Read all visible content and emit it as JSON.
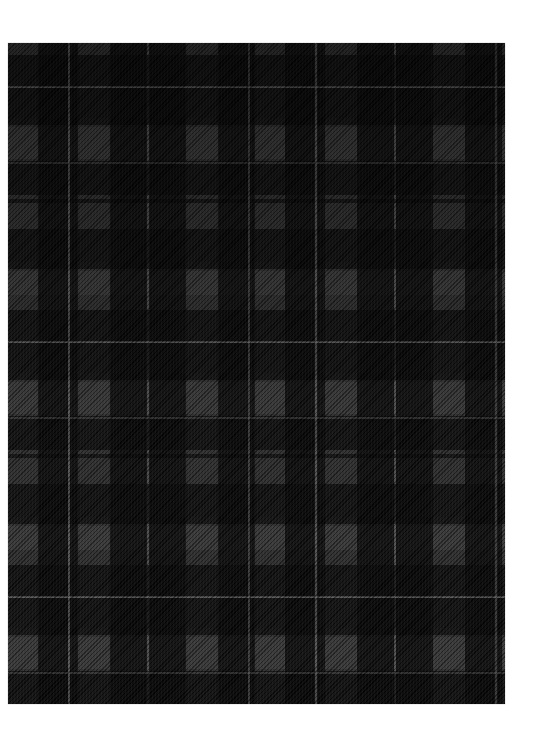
{
  "image": {
    "subject": "black and grey tartan plaid fabric swatch",
    "background_color": "#ffffff",
    "fabric": {
      "position": {
        "x": 8,
        "y": 43,
        "width": 497,
        "height": 661
      },
      "colors": {
        "black": "#050505",
        "dark_grey": "#222222",
        "medium_grey": "#3a3a3a",
        "light_line": "#5a5a5a"
      },
      "pattern": {
        "type": "tartan",
        "weave": "twill",
        "horizontal_repeat_px": 247,
        "vertical_repeat_px": 255
      }
    }
  }
}
